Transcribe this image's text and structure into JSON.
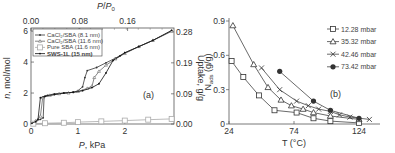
{
  "chart_data": [
    {
      "id": "a",
      "type": "line",
      "panel_label": "(a)",
      "xlabel": "P, kPa",
      "ylabel": "n, mol/mol",
      "x2label": "P/P0",
      "y2label": "Uptake, g/g",
      "xlim": [
        0,
        3.05
      ],
      "ylim": [
        0,
        6.2
      ],
      "x_ticks": [
        0,
        1,
        2
      ],
      "y_ticks": [
        0,
        2,
        4,
        6
      ],
      "x2_ticks": [
        "0.00",
        "0.08",
        "0.16"
      ],
      "x2_tick_positions_kpa": [
        0,
        1.04,
        2.06
      ],
      "y2_ticks": [
        "0.00",
        "0.09",
        "0.19",
        "0.28"
      ],
      "y2_tick_positions_n": [
        0,
        1.95,
        3.95,
        5.95
      ],
      "grid": false,
      "legend_position": "upper-left",
      "series": [
        {
          "name": "CaCl2/SBA (8.1 nm)",
          "color": "#333333",
          "marker": "dot",
          "points": [
            [
              0.02,
              0.05
            ],
            [
              0.1,
              0.2
            ],
            [
              0.2,
              0.3
            ],
            [
              0.26,
              0.4
            ],
            [
              0.28,
              1.75
            ],
            [
              0.35,
              1.85
            ],
            [
              0.5,
              1.95
            ],
            [
              0.7,
              2.0
            ],
            [
              0.9,
              2.05
            ],
            [
              1.0,
              2.15
            ],
            [
              1.1,
              2.4
            ],
            [
              1.15,
              3.0
            ],
            [
              1.2,
              3.45
            ],
            [
              1.4,
              3.65
            ],
            [
              1.6,
              3.95
            ],
            [
              1.8,
              4.25
            ],
            [
              2.0,
              4.6
            ],
            [
              2.3,
              5.0
            ],
            [
              2.6,
              5.4
            ],
            [
              3.0,
              6.0
            ]
          ]
        },
        {
          "name": "CaCl2/SBA (11.6 nm)",
          "color": "#666666",
          "marker": "small-triangle",
          "points": [
            [
              0.02,
              0.05
            ],
            [
              0.1,
              0.2
            ],
            [
              0.2,
              0.5
            ],
            [
              0.25,
              1.7
            ],
            [
              0.4,
              1.85
            ],
            [
              0.6,
              1.95
            ],
            [
              0.8,
              2.0
            ],
            [
              1.0,
              2.1
            ],
            [
              1.2,
              2.3
            ],
            [
              1.3,
              2.45
            ],
            [
              1.35,
              3.0
            ],
            [
              1.45,
              3.4
            ],
            [
              1.6,
              3.8
            ],
            [
              1.8,
              4.2
            ],
            [
              2.0,
              4.55
            ],
            [
              2.3,
              5.0
            ],
            [
              2.6,
              5.4
            ],
            [
              3.0,
              6.0
            ]
          ]
        },
        {
          "name": "Pure SBA (11.6 nm)",
          "color": "#aaaaaa",
          "marker": "open-square",
          "points": [
            [
              0.05,
              0.02
            ],
            [
              0.3,
              0.05
            ],
            [
              0.7,
              0.08
            ],
            [
              1.0,
              0.12
            ],
            [
              1.5,
              0.17
            ],
            [
              2.0,
              0.22
            ],
            [
              2.5,
              0.28
            ],
            [
              3.0,
              0.33
            ]
          ]
        },
        {
          "name": "SWS-1L (15 nm)",
          "color": "#111111",
          "marker": "dot",
          "points": [
            [
              0.02,
              0.05
            ],
            [
              0.1,
              0.15
            ],
            [
              0.15,
              0.3
            ],
            [
              0.2,
              1.7
            ],
            [
              0.3,
              1.8
            ],
            [
              0.5,
              1.9
            ],
            [
              0.7,
              2.0
            ],
            [
              0.9,
              2.05
            ],
            [
              1.1,
              2.15
            ],
            [
              1.3,
              2.35
            ],
            [
              1.45,
              2.6
            ],
            [
              1.6,
              3.3
            ],
            [
              1.75,
              4.1
            ],
            [
              1.9,
              4.4
            ],
            [
              2.0,
              4.6
            ],
            [
              2.3,
              5.0
            ],
            [
              2.6,
              5.4
            ],
            [
              3.0,
              6.05
            ]
          ]
        }
      ]
    },
    {
      "id": "b",
      "type": "line",
      "panel_label": "(b)",
      "xlabel": "T (°C)",
      "ylabel": "N_ads (g/g)",
      "xlim": [
        24,
        140
      ],
      "ylim": [
        0,
        0.9
      ],
      "x_ticks": [
        24,
        74,
        124
      ],
      "y_ticks": [
        0,
        0.3,
        0.6,
        0.9
      ],
      "y_tick_labels": [
        "0",
        "0.3",
        "0.6",
        "0.9"
      ],
      "grid": false,
      "legend_position": "upper-right",
      "series": [
        {
          "name": "12.28 mbar",
          "marker": "open-square",
          "x": [
            26,
            35,
            47,
            59,
            76,
            89,
            102,
            124
          ],
          "y": [
            0.55,
            0.41,
            0.25,
            0.12,
            0.1,
            0.05,
            0.025,
            0.01
          ]
        },
        {
          "name": "35.32 mbar",
          "marker": "open-triangle",
          "x": [
            27,
            43,
            54,
            64,
            72,
            81,
            89,
            102,
            124
          ],
          "y": [
            0.86,
            0.52,
            0.32,
            0.21,
            0.16,
            0.13,
            0.1,
            0.07,
            0.04
          ]
        },
        {
          "name": "42.46 mbar",
          "marker": "x",
          "x": [
            49,
            63,
            76,
            85,
            93,
            102,
            109,
            117,
            132
          ],
          "y": [
            0.49,
            0.3,
            0.2,
            0.16,
            0.13,
            0.11,
            0.08,
            0.06,
            0.04
          ]
        },
        {
          "name": "73.42 mbar",
          "marker": "filled-circle",
          "x": [
            63,
            89,
            102,
            124
          ],
          "y": [
            0.46,
            0.2,
            0.12,
            0.05
          ]
        }
      ]
    }
  ],
  "labels": {
    "a": {
      "panel": "(a)",
      "xlabel_italic": "P",
      "xlabel_rest": ", kPa",
      "ylabel_italic": "n",
      "ylabel_rest": ", mol/mol",
      "x2label_p": "P",
      "x2label_slash": "/",
      "x2label_p0": "P",
      "x2label_sub": "0",
      "y2label": "Uptake, g/g",
      "legend": [
        "CaCl₂/SBA (8.1 nm)",
        "CaCl₂/SBA (11.6 nm)",
        "Pure SBA (11.6 nm)",
        "SWS-1L (15 nm)"
      ]
    },
    "b": {
      "panel": "(b)",
      "xlabel": "T (°C)",
      "ylabel_main": "N",
      "ylabel_sub": "ads",
      "ylabel_rest": " (g/g)",
      "legend": [
        "12.28 mbar",
        "35.32 mbar",
        "42.46 mbar",
        "73.42 mbar"
      ]
    }
  }
}
